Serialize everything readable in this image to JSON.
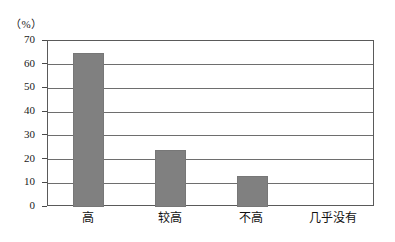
{
  "chart_data": {
    "type": "bar",
    "title": "",
    "subtitle": "",
    "xlabel": "",
    "ylabel": "",
    "unit_label": "（%）",
    "categories": [
      "高",
      "较高",
      "不高",
      "几乎没有"
    ],
    "values": [
      65,
      24,
      13,
      0
    ],
    "series": [
      {
        "name": "",
        "values": [
          65,
          24,
          13,
          0
        ]
      }
    ],
    "ylim": [
      0,
      70
    ],
    "ytick_labels": [
      "0",
      "10",
      "20",
      "30",
      "40",
      "50",
      "60",
      "70"
    ],
    "ytick_values": [
      0,
      10,
      20,
      30,
      40,
      50,
      60,
      70
    ],
    "grid": true,
    "legend": false,
    "legend_position": "none",
    "bar_color": "#808080",
    "grid_color": "#6e6e6e",
    "axis_color": "#5a5a5a",
    "background_color": "#ffffff"
  }
}
